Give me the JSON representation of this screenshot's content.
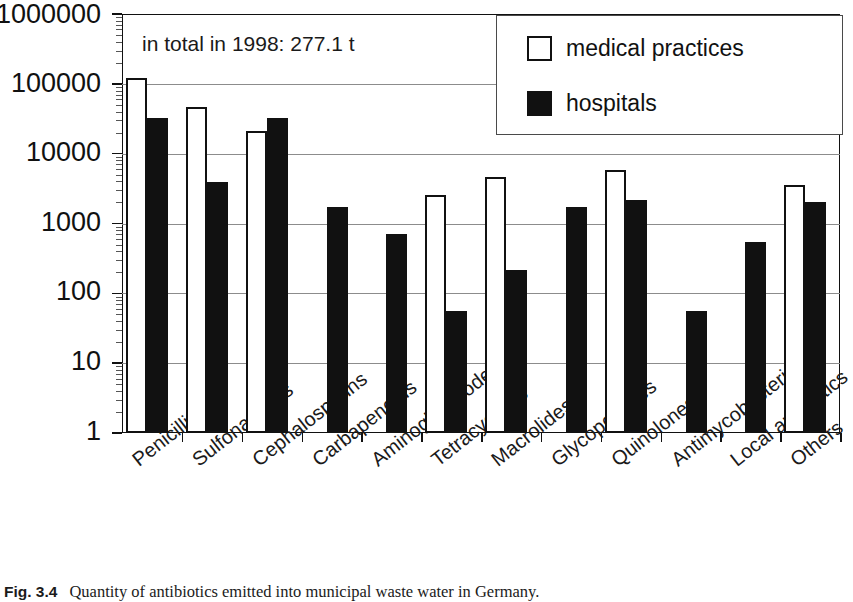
{
  "figure": {
    "caption_number": "Fig. 3.4",
    "caption_text": "Quantity of antibiotics emitted into municipal waste water in Germany."
  },
  "annotation": "in total in 1998: 277.1 t",
  "legend": {
    "entries": [
      {
        "label": "medical practices",
        "color": "#ffffff",
        "swatch": "open-square"
      },
      {
        "label": "hospitals",
        "color": "#111111",
        "swatch": "filled-square"
      }
    ]
  },
  "axis": {
    "y_ticks": [
      "1000000",
      "100000",
      "10000",
      "1000",
      "100",
      "10",
      "1"
    ]
  },
  "chart_data": {
    "type": "bar",
    "title": "Quantity of antibiotics emitted into municipal waste water in Germany.",
    "subtitle": "in total in 1998: 277.1 t",
    "xlabel": "",
    "ylabel": "",
    "yscale": "log",
    "ylim": [
      1,
      1000000
    ],
    "yticks": [
      1,
      10,
      100,
      1000,
      10000,
      100000,
      1000000
    ],
    "grid": true,
    "legend_position": "top-right",
    "categories": [
      "Penicillins",
      "Sulfonamides",
      "Cephalosporins",
      "Carbapenems",
      "Aminoglycosodes",
      "Tetracyclines",
      "Macrolides",
      "Glycopeptides",
      "Quinolones",
      "Antimycobacterial",
      "Local antibiotics",
      "Others"
    ],
    "series": [
      {
        "name": "medical practices",
        "color": "#ffffff",
        "values": [
          120000,
          46000,
          21000,
          null,
          null,
          2600,
          4600,
          null,
          5800,
          null,
          null,
          3600
        ]
      },
      {
        "name": "hospitals",
        "color": "#111111",
        "values": [
          32000,
          3900,
          32000,
          1750,
          700,
          55,
          215,
          1700,
          2200,
          55,
          540,
          2050
        ]
      }
    ]
  }
}
